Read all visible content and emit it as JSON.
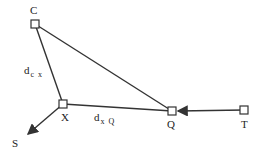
{
  "diagram": {
    "nodes": [
      {
        "id": "C",
        "label": "C",
        "x": 35,
        "y": 24
      },
      {
        "id": "X",
        "label": "X",
        "x": 63,
        "y": 104
      },
      {
        "id": "Q",
        "label": "Q",
        "x": 172,
        "y": 111
      },
      {
        "id": "T",
        "label": "T",
        "x": 244,
        "y": 110
      }
    ],
    "endpoints": [
      {
        "id": "S",
        "label": "S",
        "x": 26,
        "y": 136
      }
    ],
    "edges": [
      {
        "from": "C",
        "to": "X",
        "label": "d",
        "label_sub": "c x"
      },
      {
        "from": "C",
        "to": "Q"
      },
      {
        "from": "X",
        "to": "Q",
        "label": "d",
        "label_sub": "x Q"
      },
      {
        "from": "T",
        "to": "Q",
        "arrow": true
      },
      {
        "from": "X",
        "to": "S",
        "arrow": true
      }
    ],
    "colors": {
      "line": "#333333",
      "background": "#ffffff"
    }
  }
}
